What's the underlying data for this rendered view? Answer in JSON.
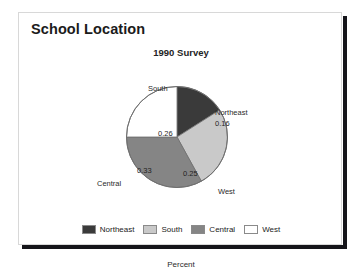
{
  "page_title": "School Location",
  "card": {
    "border_color": "#d8d8d8",
    "shadow_color": "#15151a"
  },
  "chart_data": {
    "type": "pie",
    "title": "1990 Survey",
    "xlabel": "Percent",
    "ylabel": "",
    "legend_position": "bottom",
    "grid": false,
    "start_angle_deg": 0,
    "direction": "clockwise",
    "labels": [
      "Northeast",
      "South",
      "Central",
      "West"
    ],
    "values": [
      0.16,
      0.26,
      0.33,
      0.25
    ],
    "value_labels": [
      "0.16",
      "0.26",
      "0.33",
      "0.25"
    ],
    "colors": [
      "#3a3a3a",
      "#c9c9c9",
      "#858585",
      "#ffffff"
    ],
    "slices": [
      {
        "label": "Northeast",
        "value": 0.16,
        "value_label": "0.16",
        "color": "#3a3a3a"
      },
      {
        "label": "South",
        "value": 0.26,
        "value_label": "0.26",
        "color": "#c9c9c9"
      },
      {
        "label": "Central",
        "value": 0.33,
        "value_label": "0.33",
        "color": "#858585"
      },
      {
        "label": "West",
        "value": 0.25,
        "value_label": "0.25",
        "color": "#ffffff"
      }
    ]
  },
  "legend": {
    "items": [
      {
        "label": "Northeast",
        "color": "#3a3a3a"
      },
      {
        "label": "South",
        "color": "#c9c9c9"
      },
      {
        "label": "Central",
        "color": "#858585"
      },
      {
        "label": "West",
        "color": "#ffffff"
      }
    ]
  }
}
